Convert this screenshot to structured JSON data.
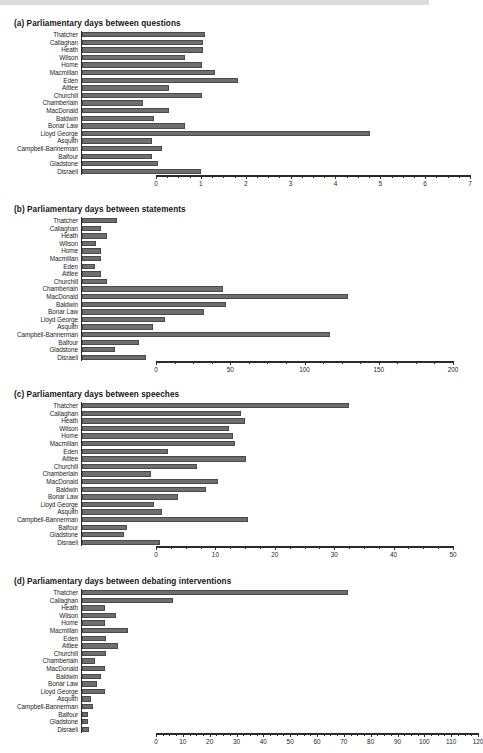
{
  "figure": {
    "categories": [
      "Thatcher",
      "Callaghan",
      "Heath",
      "Wilson",
      "Home",
      "Macmillan",
      "Eden",
      "Attlee",
      "Churchill",
      "Chamberlain",
      "MacDonald",
      "Baldwin",
      "Bonar Law",
      "Lloyd George",
      "Asquith",
      "Campbell-Bannerman",
      "Balfour",
      "Gladstone",
      "Disraeli"
    ],
    "bar_color": "#6e6e6e",
    "axis_color": "#2b2b2b"
  },
  "chart_data": [
    {
      "type": "bar",
      "orientation": "horizontal",
      "title": "(a) Parliamentary days between questions",
      "xlabel": "",
      "ylabel": "",
      "xlim": [
        0,
        7
      ],
      "xticks": [
        0,
        1,
        2,
        3,
        4,
        5,
        6,
        7
      ],
      "xtick_labels": [
        "0",
        "1",
        "2",
        "3",
        "4",
        "5",
        "6",
        "7"
      ],
      "minor_tick_step": 0.25,
      "grid": false,
      "legend": "none",
      "categories": [
        "Thatcher",
        "Callaghan",
        "Heath",
        "Wilson",
        "Home",
        "Macmillan",
        "Eden",
        "Attlee",
        "Churchill",
        "Chamberlain",
        "MacDonald",
        "Baldwin",
        "Bonar Law",
        "Lloyd George",
        "Asquith",
        "Campbell-Bannerman",
        "Balfour",
        "Gladstone",
        "Disraeli"
      ],
      "values": [
        2.75,
        2.7,
        2.7,
        2.3,
        2.68,
        2.97,
        3.47,
        1.95,
        2.68,
        1.35,
        1.95,
        1.6,
        2.3,
        6.42,
        1.57,
        1.78,
        1.55,
        1.7,
        2.65
      ]
    },
    {
      "type": "bar",
      "orientation": "horizontal",
      "title": "(b) Parliamentary days between statements",
      "xlabel": "",
      "ylabel": "",
      "xlim": [
        0,
        200
      ],
      "xticks": [
        0,
        50,
        100,
        150,
        200
      ],
      "xtick_labels": [
        "0",
        "50",
        "100",
        "150",
        "200"
      ],
      "minor_tick_step": 12.5,
      "grid": false,
      "legend": "none",
      "categories": [
        "Thatcher",
        "Callaghan",
        "Heath",
        "Wilson",
        "Home",
        "Macmillan",
        "Eden",
        "Attlee",
        "Churchill",
        "Chamberlain",
        "MacDonald",
        "Baldwin",
        "Bonar Law",
        "Lloyd George",
        "Asquith",
        "Campbell-Bannerman",
        "Balfour",
        "Gladstone",
        "Disraeli"
      ],
      "values": [
        23.5,
        12.5,
        16.5,
        9.5,
        12.5,
        13.0,
        9.0,
        12.5,
        16.5,
        95.0,
        179.0,
        97.0,
        82.0,
        56.0,
        48.0,
        167.0,
        38.5,
        22.0,
        43.0
      ]
    },
    {
      "type": "bar",
      "orientation": "horizontal",
      "title": "(c) Parliamentary days between speeches",
      "xlabel": "",
      "ylabel": "",
      "xlim": [
        0,
        50
      ],
      "xticks": [
        0,
        10,
        20,
        30,
        40,
        50
      ],
      "xtick_labels": [
        "0",
        "10",
        "20",
        "30",
        "40",
        "50"
      ],
      "minor_tick_step": 2.5,
      "grid": false,
      "legend": "none",
      "categories": [
        "Thatcher",
        "Callaghan",
        "Heath",
        "Wilson",
        "Home",
        "Macmillan",
        "Eden",
        "Attlee",
        "Churchill",
        "Chamberlain",
        "MacDonald",
        "Baldwin",
        "Bonar Law",
        "Lloyd George",
        "Asquith",
        "Campbell-Bannerman",
        "Balfour",
        "Gladstone",
        "Disraeli"
      ],
      "values": [
        45.0,
        26.8,
        27.4,
        24.8,
        25.4,
        25.7,
        14.5,
        27.6,
        19.4,
        11.6,
        22.9,
        20.8,
        16.2,
        12.2,
        13.4,
        28.0,
        7.6,
        7.0,
        13.1
      ]
    },
    {
      "type": "bar",
      "orientation": "horizontal",
      "title": "(d) Parliamentary days between debating interventions",
      "xlabel": "",
      "ylabel": "",
      "xlim": [
        0,
        120
      ],
      "xticks": [
        0,
        10,
        20,
        30,
        40,
        50,
        60,
        70,
        80,
        90,
        100,
        110,
        120
      ],
      "xtick_labels": [
        "0",
        "10",
        "20",
        "30",
        "40",
        "50",
        "60",
        "70",
        "80",
        "90",
        "100",
        "110",
        "120"
      ],
      "minor_tick_step": 2.5,
      "grid": false,
      "legend": "none",
      "categories": [
        "Thatcher",
        "Callaghan",
        "Heath",
        "Wilson",
        "Home",
        "Macmillan",
        "Eden",
        "Attlee",
        "Churchill",
        "Chamberlain",
        "MacDonald",
        "Baldwin",
        "Bonar Law",
        "Lloyd George",
        "Asquith",
        "Campbell-Bannerman",
        "Balfour",
        "Gladstone",
        "Disraeli"
      ],
      "values": [
        99.0,
        34.0,
        8.4,
        12.6,
        8.7,
        17.3,
        8.8,
        13.4,
        8.8,
        5.0,
        8.6,
        7.0,
        5.6,
        8.6,
        3.4,
        4.0,
        2.1,
        2.2,
        2.7
      ]
    }
  ]
}
